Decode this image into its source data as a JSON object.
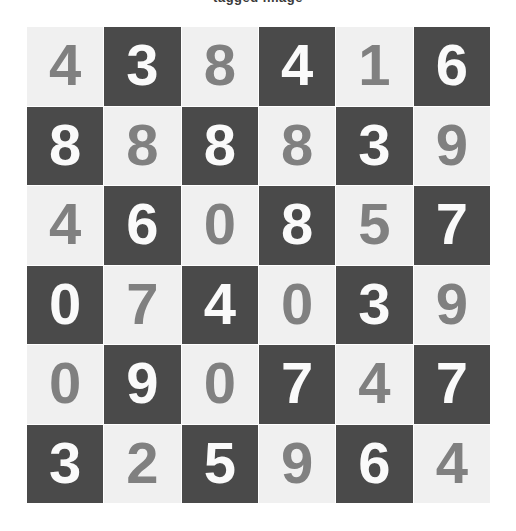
{
  "caption": {
    "text": "tagged image",
    "clipped": true
  },
  "grid": {
    "rows": 6,
    "columns": 6,
    "colors": {
      "light_cell_bg": "#f0f0f0",
      "dark_cell_bg": "#4a4a4a",
      "light_cell_digit": "#808080",
      "dark_cell_digit": "#fafafa",
      "gap": "#ffffff",
      "page_bg": "#ffffff"
    },
    "cells": [
      [
        {
          "digit": "4",
          "style": "light"
        },
        {
          "digit": "3",
          "style": "dark"
        },
        {
          "digit": "8",
          "style": "light"
        },
        {
          "digit": "4",
          "style": "dark"
        },
        {
          "digit": "1",
          "style": "light"
        },
        {
          "digit": "6",
          "style": "dark"
        }
      ],
      [
        {
          "digit": "8",
          "style": "dark"
        },
        {
          "digit": "8",
          "style": "light"
        },
        {
          "digit": "8",
          "style": "dark"
        },
        {
          "digit": "8",
          "style": "light"
        },
        {
          "digit": "3",
          "style": "dark"
        },
        {
          "digit": "9",
          "style": "light"
        }
      ],
      [
        {
          "digit": "4",
          "style": "light"
        },
        {
          "digit": "6",
          "style": "dark"
        },
        {
          "digit": "0",
          "style": "light"
        },
        {
          "digit": "8",
          "style": "dark"
        },
        {
          "digit": "5",
          "style": "light"
        },
        {
          "digit": "7",
          "style": "dark"
        }
      ],
      [
        {
          "digit": "0",
          "style": "dark"
        },
        {
          "digit": "7",
          "style": "light"
        },
        {
          "digit": "4",
          "style": "dark"
        },
        {
          "digit": "0",
          "style": "light"
        },
        {
          "digit": "3",
          "style": "dark"
        },
        {
          "digit": "9",
          "style": "light"
        }
      ],
      [
        {
          "digit": "0",
          "style": "light"
        },
        {
          "digit": "9",
          "style": "dark"
        },
        {
          "digit": "0",
          "style": "light"
        },
        {
          "digit": "7",
          "style": "dark"
        },
        {
          "digit": "4",
          "style": "light"
        },
        {
          "digit": "7",
          "style": "dark"
        }
      ],
      [
        {
          "digit": "3",
          "style": "dark"
        },
        {
          "digit": "2",
          "style": "light"
        },
        {
          "digit": "5",
          "style": "dark"
        },
        {
          "digit": "9",
          "style": "light"
        },
        {
          "digit": "6",
          "style": "dark"
        },
        {
          "digit": "4",
          "style": "light"
        }
      ]
    ]
  }
}
